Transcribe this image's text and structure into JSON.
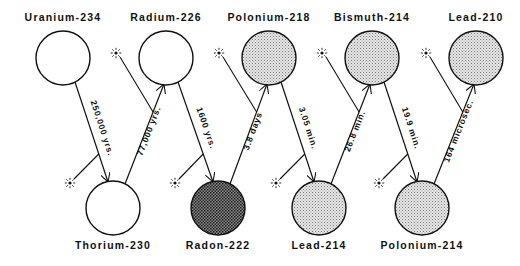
{
  "colors": {
    "stroke": "#111111",
    "unshaded_fill": "#ffffff",
    "light_stipple": "#c8c8c8",
    "dark_stipple": "#5a5a5a"
  },
  "nuclides": [
    {
      "id": "u234",
      "label": "Uranium-234",
      "row": "top",
      "cx": 63,
      "fill": "none"
    },
    {
      "id": "th230",
      "label": "Thorium-230",
      "row": "bottom",
      "cx": 113,
      "fill": "none"
    },
    {
      "id": "ra226",
      "label": "Radium-226",
      "row": "top",
      "cx": 166,
      "fill": "none"
    },
    {
      "id": "rn222",
      "label": "Radon-222",
      "row": "bottom",
      "cx": 218,
      "fill": "dark"
    },
    {
      "id": "po218",
      "label": "Polonium-218",
      "row": "top",
      "cx": 269,
      "fill": "light"
    },
    {
      "id": "pb214",
      "label": "Lead-214",
      "row": "bottom",
      "cx": 319,
      "fill": "light"
    },
    {
      "id": "bi214",
      "label": "Bismuth-214",
      "row": "top",
      "cx": 372,
      "fill": "light"
    },
    {
      "id": "po214",
      "label": "Polonium-214",
      "row": "bottom",
      "cx": 422,
      "fill": "light"
    },
    {
      "id": "pb210",
      "label": "Lead-210",
      "row": "top",
      "cx": 476,
      "fill": "light"
    }
  ],
  "decays": [
    {
      "from": "u234",
      "to": "th230",
      "half_life": "250,000 yrs."
    },
    {
      "from": "th230",
      "to": "ra226",
      "half_life": "77,000 yrs."
    },
    {
      "from": "ra226",
      "to": "rn222",
      "half_life": "1600 yrs."
    },
    {
      "from": "rn222",
      "to": "po218",
      "half_life": "3.8 days"
    },
    {
      "from": "po218",
      "to": "pb214",
      "half_life": "3.05 min."
    },
    {
      "from": "pb214",
      "to": "bi214",
      "half_life": "26.8 min."
    },
    {
      "from": "bi214",
      "to": "po214",
      "half_life": "19.9 min."
    },
    {
      "from": "po214",
      "to": "pb210",
      "half_life": "164 microsec."
    }
  ],
  "layout": {
    "top_cy": 58,
    "bottom_cy": 208,
    "radius": 27,
    "top_label_y": 11,
    "bottom_label_y": 239
  }
}
